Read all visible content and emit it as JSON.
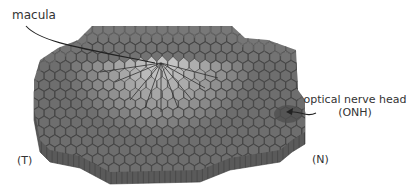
{
  "diagram": {
    "labels": {
      "macula": "macula",
      "onh_line1": "optical nerve head",
      "onh_line2": "(ONH)",
      "temporal": "(T)",
      "nasal": "(N)"
    },
    "colors": {
      "background": "#ffffff",
      "cell_dark": "#6e6e6e",
      "cell_mid": "#8c8c8c",
      "cell_light": "#c4c4c4",
      "cell_edge": "#3c3c3c",
      "side_face": "#5a5a5a",
      "onh_patch": "#4e4e4e",
      "text": "#333333",
      "arrow": "#222222"
    },
    "geometry": {
      "hex_radius": 6.2,
      "peak": [
        161,
        63
      ],
      "onh": [
        300,
        128
      ]
    }
  }
}
